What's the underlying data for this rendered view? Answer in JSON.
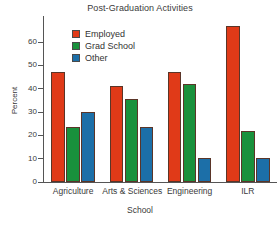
{
  "chart_data": {
    "type": "bar",
    "title": "Post-Graduation Activities",
    "xlabel": "School",
    "ylabel": "Percent",
    "categories": [
      "Agriculture",
      "Arts & Sciences",
      "Engineering",
      "ILR"
    ],
    "series": [
      {
        "name": "Employed",
        "color": "#E03A18",
        "values": [
          47,
          41,
          47,
          67
        ]
      },
      {
        "name": "Grad School",
        "color": "#19913C",
        "values": [
          23.5,
          35.5,
          42,
          22
        ]
      },
      {
        "name": "Other",
        "color": "#1C6FA8",
        "values": [
          30,
          23.5,
          10.5,
          10.5
        ]
      }
    ],
    "ylim": [
      0,
      70
    ],
    "yticks": [
      0,
      10,
      20,
      30,
      40,
      50,
      60
    ],
    "ytick_labels": [
      "0",
      "10",
      "20",
      "30",
      "40",
      "50",
      "60"
    ],
    "grid": false,
    "legend_position": "upper-left-inside",
    "bar_edge_color": "#5A3528",
    "axis_color": "#555555"
  }
}
